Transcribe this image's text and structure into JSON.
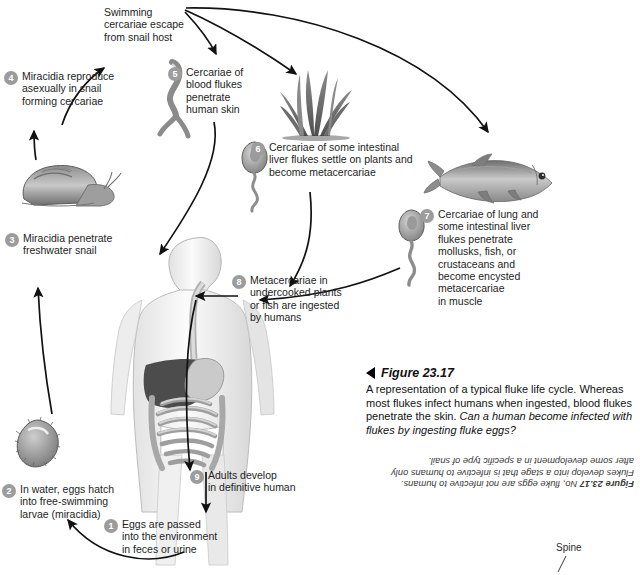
{
  "figure": {
    "number": "Figure 23.17",
    "description": "A representation of a typical fluke life cycle. Whereas most flukes infect humans when ingested, blood flukes penetrate the skin.",
    "question": "Can a human become infected with flukes by ingesting fluke eggs?",
    "answer_label": "Figure 23.17",
    "answer_text": "No, fluke eggs are not infective to humans. Flukes develop into a stage that is infective to humans only after some development in a specific type of snail.",
    "triangle_icon": "left-triangle-icon"
  },
  "free_text": {
    "swimming": "Swimming\ncercariae escape\nfrom snail host",
    "spine": "Spine"
  },
  "steps": [
    {
      "num": "1",
      "text": "Eggs are passed\ninto the environment\nin feces or urine"
    },
    {
      "num": "2",
      "text": "In water, eggs hatch\ninto free-swimming\nlarvae (miracidia)"
    },
    {
      "num": "3",
      "text": "Miracidia penetrate\nfreshwater snail"
    },
    {
      "num": "4",
      "text": "Miracidia reproduce\nasexually in snail\nforming cercariae"
    },
    {
      "num": "5",
      "text": "Cercariae of\nblood flukes\npenetrate\nhuman skin"
    },
    {
      "num": "6",
      "text": "Cercariae of some intestinal\nliver flukes settle on plants and\nbecome metacercariae"
    },
    {
      "num": "7",
      "text": "Cercariae of lung and\nsome intestinal liver\nflukes penetrate\nmollusks, fish, or\ncrustaceans and\nbecome encysted\nmetacercariae\nin muscle"
    },
    {
      "num": "8",
      "text": "Metacercariae in\nundercooked plants\nor fish are ingested\nby humans"
    },
    {
      "num": "9",
      "text": "Adults develop\nin definitive human"
    }
  ],
  "illustrations": [
    {
      "name": "snail-illustration",
      "label": "freshwater snail"
    },
    {
      "name": "miracidium-illustration",
      "label": "miracidium larva"
    },
    {
      "name": "cercaria-forked-illustration",
      "label": "forked-tail cercaria"
    },
    {
      "name": "cercaria-illustration-6",
      "label": "cercaria"
    },
    {
      "name": "cercaria-illustration-7",
      "label": "cercaria"
    },
    {
      "name": "aquatic-plant-illustration",
      "label": "aquatic plant"
    },
    {
      "name": "fish-illustration",
      "label": "fish"
    },
    {
      "name": "human-body-illustration",
      "label": "human digestive system"
    }
  ],
  "colors": {
    "badge": "#9c9c9c",
    "text": "#1d1d1d",
    "arrow": "#111111",
    "organ_liver": "#4a4a4a",
    "organ_gut": "#b9b9b9"
  }
}
